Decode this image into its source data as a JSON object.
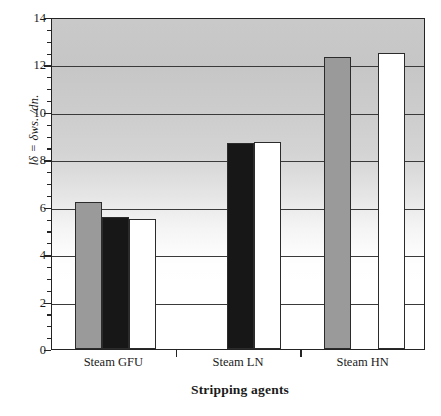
{
  "chart_data": {
    "type": "bar",
    "title": "",
    "xlabel": "Stripping agents",
    "ylabel": "lδ = δws. /dn.",
    "categories": [
      "Steam GFU",
      "Steam LN",
      "Steam HN"
    ],
    "series": [
      {
        "name": "series-gray",
        "color": "#9a9a9a",
        "values": [
          6.2,
          null,
          12.3
        ]
      },
      {
        "name": "series-black",
        "color": "#171717",
        "values": [
          5.55,
          8.7,
          null
        ]
      },
      {
        "name": "series-white",
        "color": "#ffffff",
        "values": [
          5.5,
          8.75,
          12.5
        ]
      }
    ],
    "ylim": [
      0,
      14
    ],
    "yticks": [
      0,
      2,
      4,
      6,
      8,
      10,
      12,
      14
    ],
    "ytick_labels": [
      "0",
      "2",
      "4",
      "6",
      "8",
      "10",
      "12",
      "14"
    ],
    "minor_tick_step": 0.5,
    "grid": "horizontal",
    "legend": "none",
    "plot_background": "vertical-gradient-gray-to-white"
  },
  "axis": {
    "y_title": "lδ = δws. /dn.",
    "x_title": "Stripping agents"
  }
}
